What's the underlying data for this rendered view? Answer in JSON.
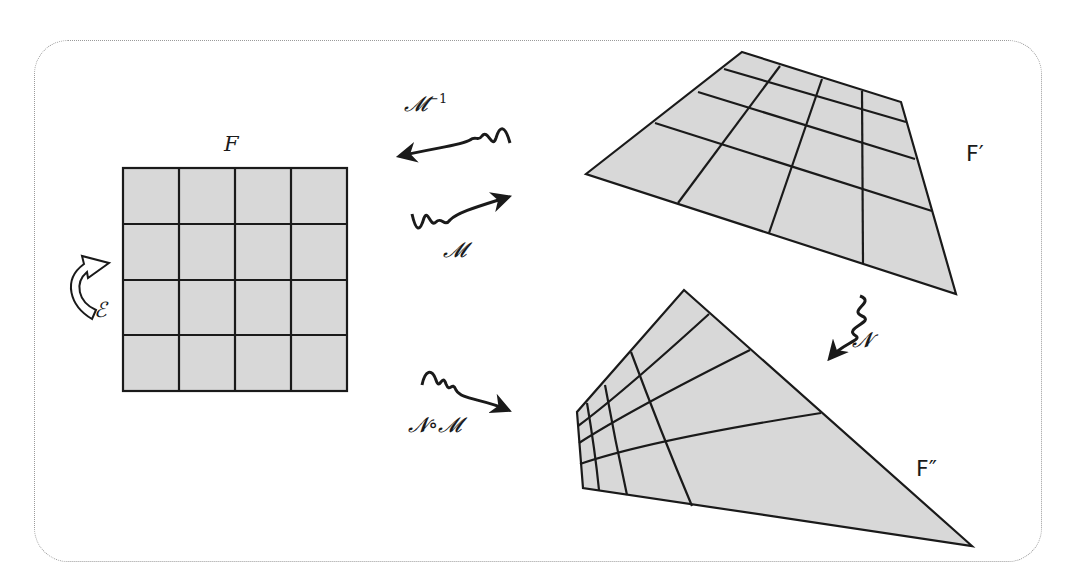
{
  "diagram": {
    "frame": {
      "style": "dotted rounded rectangle",
      "color": "#9a9a9a"
    },
    "fill_color": "#d8d8d8",
    "stroke_color": "#1a1a1a",
    "shapes": [
      {
        "id": "F",
        "label": "F",
        "kind": "square 4x4 grid"
      },
      {
        "id": "F_prime",
        "label": "F′",
        "kind": "perspective-warped 4x4 grid"
      },
      {
        "id": "F_double_prime",
        "label": "F″",
        "kind": "nonlinearly warped 4x4 grid"
      }
    ],
    "maps": [
      {
        "id": "M_inv",
        "label": "𝓜",
        "superscript": "−1",
        "direction": "F′ → F"
      },
      {
        "id": "M",
        "label": "𝓜",
        "direction": "F → F′"
      },
      {
        "id": "N",
        "label": "𝓝",
        "direction": "F′ → F″"
      },
      {
        "id": "NM",
        "label": "𝓝∘𝓜",
        "direction": "F → F″"
      },
      {
        "id": "E",
        "label": "ℰ",
        "direction": "F → F (self-map)"
      }
    ]
  }
}
